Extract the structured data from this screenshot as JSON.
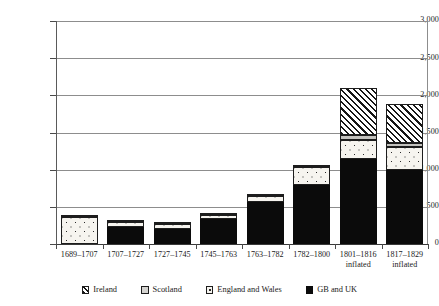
{
  "chart_data": {
    "type": "bar",
    "stacked": true,
    "title": "",
    "subtitle": "",
    "xlabel": "",
    "ylabel": "",
    "ylim": [
      0,
      3000
    ],
    "ytick_step": 500,
    "ytick_labels": [
      "0",
      "500",
      "1,000",
      "1,500",
      "2,000",
      "2,500",
      "3,000"
    ],
    "ytick_values": [
      0,
      500,
      1000,
      1500,
      2000,
      2500,
      3000
    ],
    "grid": true,
    "grid_axis": "y",
    "legend_position": "bottom",
    "categories": [
      "1689–1707",
      "1707–1727",
      "1727–1745",
      "1745–1763",
      "1763–1782",
      "1782–1800",
      "1801–1816",
      "1817–1829"
    ],
    "category_sublabels": [
      "",
      "",
      "",
      "",
      "",
      "",
      "inflated",
      "inflated"
    ],
    "series": [
      {
        "name": "GB and UK",
        "pattern": "solid-black",
        "color": "#0b0b0b",
        "values": [
          0,
          225,
          200,
          340,
          560,
          800,
          1150,
          1000
        ]
      },
      {
        "name": "England and Wales",
        "pattern": "dotted",
        "color": "#f6f4ef",
        "values": [
          370,
          75,
          75,
          55,
          80,
          230,
          250,
          300
        ]
      },
      {
        "name": "Scotland",
        "pattern": "light-grey",
        "color": "#c3c2be",
        "values": [
          25,
          10,
          10,
          10,
          15,
          25,
          60,
          60
        ]
      },
      {
        "name": "Ireland",
        "pattern": "diagonal-hatch",
        "color": "#ffffff",
        "values": [
          0,
          0,
          0,
          0,
          0,
          0,
          640,
          520
        ]
      }
    ],
    "totals": [
      395,
      310,
      285,
      405,
      655,
      1055,
      2100,
      1880
    ]
  },
  "legend": {
    "items": [
      {
        "label": "Ireland",
        "swatch": "s-ire"
      },
      {
        "label": "Scotland",
        "swatch": "s-scot"
      },
      {
        "label": "England and Wales",
        "swatch": "s-ew"
      },
      {
        "label": "GB and UK",
        "swatch": "s-gbuk"
      }
    ]
  }
}
